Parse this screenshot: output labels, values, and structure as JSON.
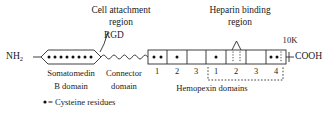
{
  "diagram": {
    "annotations": {
      "cell_attachment_line1": "Cell attachment",
      "cell_attachment_line2": "region",
      "rgd": "RGD",
      "heparin_line1": "Heparin binding",
      "heparin_line2": "region",
      "ten_k": "10K"
    },
    "termini": {
      "n_terminus_main": "NH",
      "n_terminus_sub": "2",
      "c_terminus": "COOH"
    },
    "domain_labels": {
      "somatomedin_line1": "Somatomedin",
      "somatomedin_line2": "B domain",
      "connector_line1": "Connector",
      "connector_line2": "domain",
      "hemopexin": "Hemopexin domains"
    },
    "box_numbers_left": [
      "1",
      "2",
      "3"
    ],
    "box_numbers_right": [
      "1",
      "2",
      "3",
      "4"
    ],
    "legend": {
      "symbol": "•",
      "text": "= Cysteine residues"
    },
    "colors": {
      "stroke": "#2b2b2b",
      "text": "#1a1a1a",
      "background": "#ffffff"
    },
    "somatomedin_b": {
      "shape": "hexagon",
      "cysteine_dot_count": 9
    },
    "hemopexin_boxes": [
      {
        "index": 1,
        "dots": 2
      },
      {
        "index": 2,
        "dots": 1
      },
      {
        "index": 3,
        "dots": 0
      },
      {
        "index": 4,
        "dots": 1
      },
      {
        "index": 5,
        "dots": 0
      },
      {
        "index": 6,
        "dots": 0
      },
      {
        "index": 7,
        "dots": 2
      }
    ]
  }
}
